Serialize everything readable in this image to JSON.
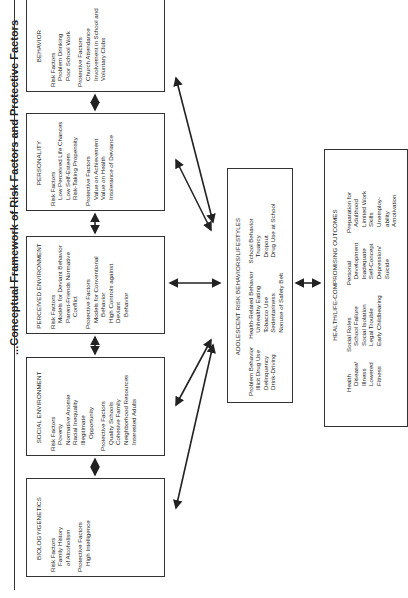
{
  "title": "...Conceptual Framework of Risk Factors and Protective Factors",
  "factor_boxes": [
    {
      "heading": "BEHAVIOR",
      "risk_label": "Risk Factors",
      "risk": [
        "Problem Drinking",
        "Poor School Work"
      ],
      "protective_label": "Protective Factors",
      "protective": [
        "Church Attendance",
        "Involvement in School and",
        "Voluntary Clubs"
      ]
    },
    {
      "heading": "PERSONALITY",
      "risk_label": "Risk Factors",
      "risk": [
        "Low Perceived Life Chances",
        "Low Self-Esteem",
        "Risk-Taking Propensity"
      ],
      "protective_label": "Protective Factors",
      "protective": [
        "Value on Achievement",
        "Value on Health",
        "Intolerance of Deviance"
      ]
    },
    {
      "heading": "PERCEIVED ENVIRONMENT",
      "risk_label": "Risk Factors",
      "risk": [
        "Models for Deviant Behavior",
        "Parent-Friends Normative",
        "Conflict"
      ],
      "protective_label": "Protective Factors",
      "protective": [
        "Models for Conventional",
        "Behavior",
        "High Controls against Deviant",
        "Behavior"
      ]
    },
    {
      "heading": "SOCIAL ENVIRONMENT",
      "risk_label": "Risk Factors",
      "risk": [
        "Poverty",
        "Normative Anomie",
        "Racial Inequality",
        "Illegitimate",
        "Opportunity"
      ],
      "protective_label": "Protective Factors",
      "protective": [
        "Quality Schools",
        "Cohesive Family",
        "Neighborhood Resources",
        "Interested Adults"
      ]
    },
    {
      "heading": "BIOLOGY/GENETICS",
      "risk_label": "Risk Factors",
      "risk": [
        "Family History",
        "of Alcoholism"
      ],
      "protective_label": "Protective Factors",
      "protective": [
        "High Intelligence"
      ]
    }
  ],
  "behaviors_box": {
    "heading": "ADOLESCENT RISK BEHAVIORS/LIFESTYLES",
    "columns": [
      {
        "label": "Problem Behavior",
        "items": [
          "Illicit Drug Use",
          "Delinquency",
          "Drink-Driving"
        ]
      },
      {
        "label": "Health-Related Behavior",
        "items": [
          "Unhealthy Eating",
          "Tobacco Use",
          "Sedentariness",
          "Nonuse of Safety Belt"
        ]
      },
      {
        "label": "School Behavior",
        "items": [
          "Truancy",
          "Dropout",
          "Drug Use at School"
        ]
      }
    ]
  },
  "outcomes_box": {
    "heading": "HEALTH/LIFE-COMPROMISING OUTCOMES",
    "columns": [
      {
        "label": "Health",
        "items": [
          "Disease/",
          "Illness",
          "Lowered",
          "Fitness"
        ]
      },
      {
        "label": "Social Roles",
        "items": [
          "School Failure",
          "Social Isolation",
          "Legal Trouble",
          "Early Childbearing"
        ]
      },
      {
        "label": "Personal",
        "items": [
          "Development",
          "Inadequate",
          "Self-Concept",
          "Depression/",
          "Suicide"
        ]
      },
      {
        "label": "Preparation for",
        "items": [
          "Adulthood",
          "Limited Work",
          "Skills",
          "Unemploy-",
          "ability",
          "Amotivation"
        ]
      }
    ]
  },
  "colors": {
    "line": "#333333",
    "text": "#1a1a1a",
    "background": "#ffffff"
  }
}
